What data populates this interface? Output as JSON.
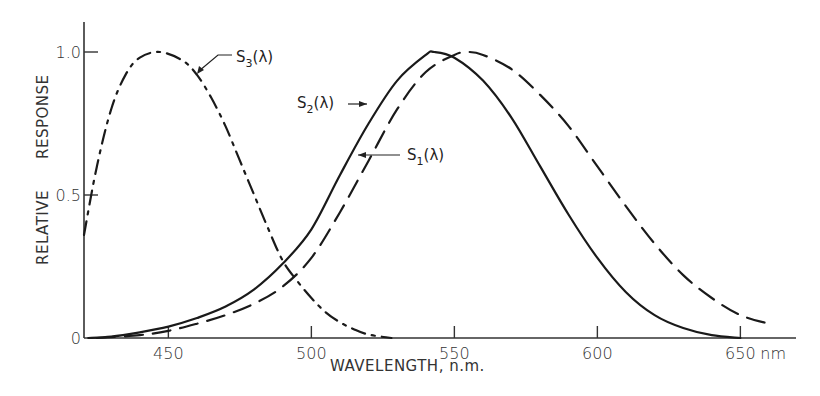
{
  "chart_data": {
    "type": "line",
    "title": "",
    "xlabel": "WAVELENGTH, n.m.",
    "ylabel": "RELATIVE RESPONSE",
    "xlim": [
      420,
      665
    ],
    "ylim": [
      0,
      1.1
    ],
    "x_ticks": [
      450,
      500,
      550,
      600,
      650
    ],
    "x_tick_labels": [
      "450",
      "500",
      "550",
      "600",
      "650"
    ],
    "x_unit_label": "nm",
    "y_ticks": [
      0,
      0.5,
      1.0
    ],
    "y_tick_labels": [
      "0",
      "0.5",
      "1.0"
    ],
    "grid": false,
    "legend": "inline annotations with arrows",
    "series": [
      {
        "name": "S1(λ)",
        "label_main": "S",
        "label_sub": "1",
        "label_suffix": "(λ)",
        "style": "dashed",
        "x": [
          425,
          440,
          450,
          460,
          470,
          480,
          490,
          500,
          510,
          520,
          530,
          540,
          550,
          555,
          560,
          570,
          580,
          590,
          600,
          610,
          620,
          630,
          640,
          650,
          660
        ],
        "y": [
          0.0,
          0.01,
          0.025,
          0.05,
          0.08,
          0.12,
          0.18,
          0.28,
          0.44,
          0.62,
          0.8,
          0.93,
          0.99,
          1.0,
          0.99,
          0.94,
          0.85,
          0.74,
          0.6,
          0.46,
          0.33,
          0.22,
          0.14,
          0.08,
          0.05
        ]
      },
      {
        "name": "S2(λ)",
        "label_main": "S",
        "label_sub": "2",
        "label_suffix": "(λ)",
        "style": "solid",
        "x": [
          422,
          430,
          440,
          450,
          460,
          470,
          480,
          490,
          500,
          510,
          520,
          530,
          540,
          543,
          550,
          560,
          570,
          580,
          590,
          600,
          610,
          620,
          630,
          640,
          650
        ],
        "y": [
          0.0,
          0.005,
          0.02,
          0.04,
          0.07,
          0.11,
          0.17,
          0.26,
          0.38,
          0.57,
          0.75,
          0.9,
          0.99,
          1.0,
          0.98,
          0.9,
          0.77,
          0.6,
          0.43,
          0.28,
          0.16,
          0.08,
          0.035,
          0.01,
          0.0
        ]
      },
      {
        "name": "S3(λ)",
        "label_main": "S",
        "label_sub": "3",
        "label_suffix": "(λ)",
        "style": "dash-dot",
        "x": [
          420.5,
          425,
          430,
          435,
          440,
          447,
          455,
          460,
          465,
          470,
          475,
          480,
          485,
          490,
          495,
          500,
          505,
          510,
          515,
          520,
          528
        ],
        "y": [
          0.36,
          0.6,
          0.8,
          0.92,
          0.98,
          1.0,
          0.97,
          0.92,
          0.84,
          0.74,
          0.62,
          0.5,
          0.38,
          0.27,
          0.2,
          0.14,
          0.09,
          0.055,
          0.03,
          0.012,
          0.0
        ]
      }
    ]
  }
}
